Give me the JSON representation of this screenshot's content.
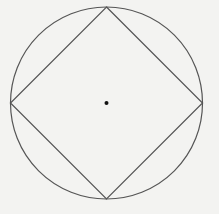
{
  "diagram": {
    "colors": {
      "background": "#f3f3f1",
      "stroke": "#555555",
      "center_point": "#111111"
    },
    "circle": {
      "cx": 106.5,
      "cy": 103,
      "r": 96
    },
    "square": {
      "vertices": [
        {
          "name": "top",
          "x": 106.5,
          "y": 7
        },
        {
          "name": "right",
          "x": 202.5,
          "y": 103
        },
        {
          "name": "bottom",
          "x": 106.5,
          "y": 199
        },
        {
          "name": "left",
          "x": 10.5,
          "y": 103
        }
      ]
    },
    "center_point": {
      "x": 106.5,
      "y": 103,
      "r": 2
    }
  }
}
